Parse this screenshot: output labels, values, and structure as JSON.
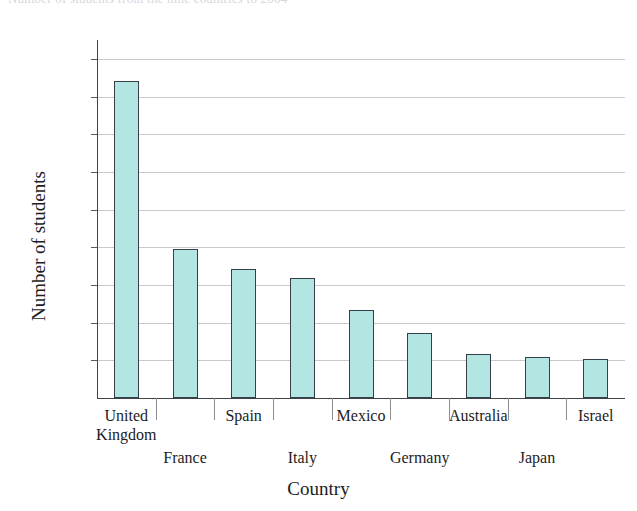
{
  "chart_data": {
    "type": "bar",
    "title": "",
    "xlabel": "Country",
    "ylabel": "Number of students",
    "categories": [
      "United Kingdom",
      "France",
      "Spain",
      "Italy",
      "Mexico",
      "Germany",
      "Australia",
      "Japan",
      "Israel"
    ],
    "values": [
      16850,
      7900,
      6850,
      6350,
      4650,
      3450,
      2350,
      2200,
      2050
    ],
    "ylim": [
      0,
      19000
    ],
    "ytick_values": [
      2000,
      4000,
      6000,
      8000,
      10000,
      12000,
      14000,
      16000,
      18000
    ],
    "ytick_labels": [
      "2,000",
      "4,000",
      "6,000",
      "8,000",
      "10,000",
      "12,000",
      "14,000",
      "16,000",
      "18,000"
    ],
    "grid": true,
    "legend": "none",
    "bar_color": "#b3e5e3",
    "bar_edge_color": "#33404a",
    "grid_color": "#c9c9cf",
    "axis_color": "#42424a",
    "label_rows": [
      0,
      1,
      0,
      1,
      0,
      1,
      0,
      1,
      0
    ]
  },
  "figure": {
    "ghost_title": "Number of students from the nine countries to 2004",
    "axis_titles": {
      "y": "Number of students",
      "x": "Country"
    }
  }
}
